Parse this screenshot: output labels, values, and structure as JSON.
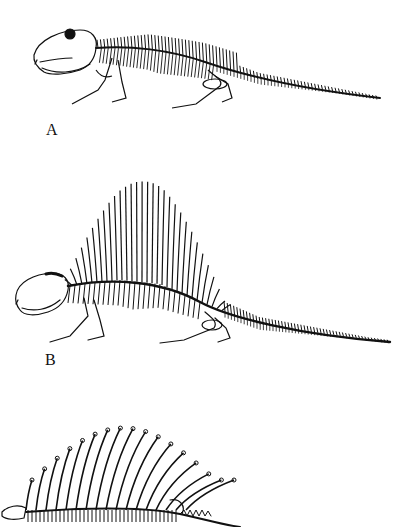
{
  "page": {
    "background": "#ffffff",
    "ink": "#111111"
  },
  "figures": [
    {
      "label": "A",
      "sail": "low",
      "visible": "full"
    },
    {
      "label": "B",
      "sail": "tall",
      "visible": "full"
    },
    {
      "label": "C",
      "sail": "medium, spines with crossbars",
      "visible": "partial (cut off at bottom)"
    }
  ]
}
